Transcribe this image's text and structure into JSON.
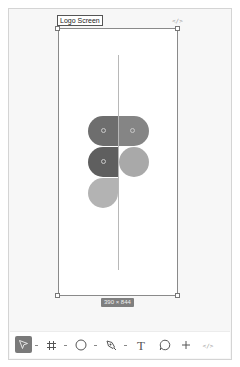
{
  "canvas": {
    "frame": {
      "name": "Logo Screen",
      "size_label": "390 × 844",
      "code_icon": "code-icon"
    },
    "logo": {
      "name": "figma-logo",
      "colors": {
        "top_left": "#6e6e6e",
        "top_right": "#858585",
        "mid_left": "#5f5f5f",
        "mid_right": "#a9a9a9",
        "bottom_left": "#b3b3b3"
      }
    }
  },
  "toolbar": {
    "tools": [
      {
        "id": "move",
        "icon": "cursor-arrow-icon",
        "active": true,
        "has_menu": true
      },
      {
        "id": "frame",
        "icon": "frame-hash-icon",
        "active": false,
        "has_menu": true
      },
      {
        "id": "shape",
        "icon": "ellipse-icon",
        "active": false,
        "has_menu": true
      },
      {
        "id": "pen",
        "icon": "pen-tool-icon",
        "active": false,
        "has_menu": true
      },
      {
        "id": "text",
        "icon": "text-icon",
        "label": "T",
        "active": false
      },
      {
        "id": "comment",
        "icon": "comment-icon",
        "active": false
      },
      {
        "id": "actions",
        "icon": "plus-icon",
        "label": "+",
        "active": false
      },
      {
        "id": "dev-mode",
        "icon": "code-icon",
        "label": "</>",
        "active": false
      }
    ]
  },
  "code_glyph": "</>"
}
